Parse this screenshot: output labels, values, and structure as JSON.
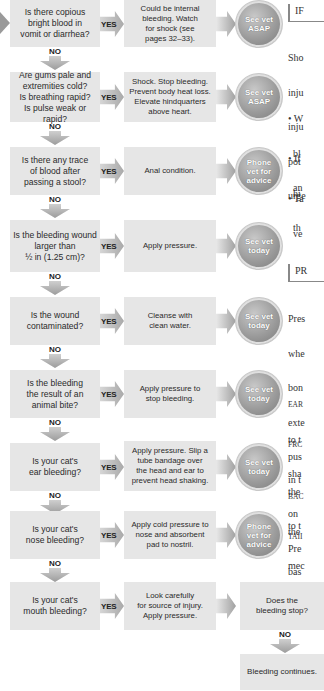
{
  "flowchart": {
    "yes_label": "YES",
    "no_label": "NO",
    "steps": [
      {
        "question": "Is there copious\nbright blood in\nvomit or diarrhea?",
        "action": "Could be internal\nbleeding. Watch\nfor shock (see\npages 32–33).",
        "outcome": "See vet\nASAP"
      },
      {
        "question": "Are gums pale and\nextremities cold?\nIs breathing rapid?\nIs pulse weak or rapid?",
        "action": "Shock. Stop bleeding.\nPrevent body heat loss.\nElevate hindquarters\nabove heart.",
        "outcome": "See vet\nASAP"
      },
      {
        "question": "Is there any trace\nof blood after\npassing a stool?",
        "action": "Anal condition.",
        "outcome": "Phone\nvet for\nadvice"
      },
      {
        "question": "Is the bleeding wound\nlarger than\n½ in (1.25 cm)?",
        "action": "Apply pressure.",
        "outcome": "See vet\ntoday"
      },
      {
        "question": "Is the wound\ncontaminated?",
        "action": "Cleanse with\nclean water.",
        "outcome": "See vet\ntoday"
      },
      {
        "question": "Is the bleeding\nthe result of an\nanimal bite?",
        "action": "Apply pressure to\nstop bleeding.",
        "outcome": "See vet\ntoday"
      },
      {
        "question": "Is your cat's\near bleeding?",
        "action": "Apply pressure. Slip a\ntube bandage over\nthe head and ear to\nprevent head shaking.",
        "outcome": "See vet\ntoday"
      },
      {
        "question": "Is your cat's\nnose bleeding?",
        "action": "Apply cold pressure to\nnose and absorbent\npad to nostril.",
        "outcome": "Phone\nvet for\nadvice"
      },
      {
        "question": "Is your cat's\nmouth bleeding?",
        "action": "Look carefully\nfor source of injury.\nApply pressure.",
        "outcome": null
      }
    ],
    "followup": {
      "question": "Does the\nbleeding stop?",
      "no_result": "Bleeding continues."
    }
  },
  "sidebar": {
    "section1": {
      "heading": "IF",
      "lines": [
        "Sho",
        "inju",
        "inju",
        "pot",
        "urge"
      ],
      "bullets": [
        [
          "• W",
          "  bl",
          "  an"
        ],
        [
          "• If",
          "  hi",
          "  th"
        ],
        [
          "• Ta",
          "  ve"
        ]
      ]
    },
    "section2": {
      "heading": "PR",
      "lines": [
        "Pres",
        "whe",
        "bon",
        "exte",
        "pus",
        "the",
        "to t"
      ],
      "paras": [
        [
          "EAR",
          "to t",
          "sha"
        ],
        [
          "FRC",
          "in t",
          "on",
          "Pre"
        ],
        [
          "BAC",
          "the",
          "mec"
        ],
        [
          "TAII",
          "bas"
        ]
      ]
    }
  },
  "colors": {
    "box_fill": "#e6e6e6",
    "arrow_gray": "#a9a9a9",
    "circle_gray": "#9a9a9a",
    "circle_text": "#ffffff",
    "text_dark": "#2a2a2a"
  }
}
